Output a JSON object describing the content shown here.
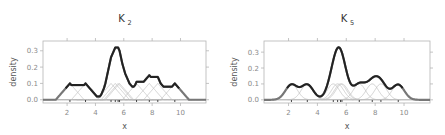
{
  "chart_data": [
    {
      "type": "line",
      "title": "K2",
      "title_main": "K",
      "title_sub": "2",
      "kernel": "triangular",
      "xlabel": "x",
      "ylabel": "density",
      "xlim": [
        0.3,
        11.8
      ],
      "ylim": [
        -0.02,
        0.36
      ],
      "xticks": [
        2,
        4,
        6,
        8,
        10
      ],
      "yticks": [
        0.0,
        0.1,
        0.2,
        0.3
      ],
      "ytick_labels": [
        "0.0",
        "0.1",
        "0.2",
        "0.3"
      ],
      "grid": false,
      "data_points": [
        2.2,
        3.3,
        5.1,
        5.4,
        5.6,
        5.7,
        6.9,
        7.8,
        8.4,
        9.6
      ],
      "bandwidth": 1.0,
      "peak_density": 0.32,
      "series": [
        {
          "name": "density estimate",
          "x": [
            0.3,
            1.2,
            2.2,
            2.7,
            3.3,
            4.3,
            4.6,
            5.1,
            5.4,
            5.6,
            5.7,
            6.0,
            6.4,
            6.9,
            7.3,
            7.8,
            8.4,
            8.8,
            9.6,
            10.6,
            11.8
          ],
          "values": [
            0,
            0,
            0.1,
            0.09,
            0.1,
            0.02,
            0.06,
            0.23,
            0.31,
            0.32,
            0.31,
            0.2,
            0.12,
            0.11,
            0.11,
            0.14,
            0.14,
            0.08,
            0.1,
            0,
            0
          ]
        }
      ],
      "frame_px": {
        "left": 43,
        "right": 206,
        "top": 41,
        "bottom": 103
      }
    },
    {
      "type": "line",
      "title": "K5",
      "title_main": "K",
      "title_sub": "5",
      "kernel": "gaussian",
      "xlabel": "x",
      "ylabel": "density",
      "xlim": [
        0.3,
        11.8
      ],
      "ylim": [
        -0.02,
        0.37
      ],
      "xticks": [
        2,
        4,
        6,
        8,
        10
      ],
      "yticks": [
        0.0,
        0.1,
        0.2,
        0.3
      ],
      "ytick_labels": [
        "0.0",
        "0.1",
        "0.2",
        "0.3"
      ],
      "grid": false,
      "data_points": [
        2.2,
        3.3,
        5.1,
        5.4,
        5.6,
        5.7,
        6.9,
        7.8,
        8.4,
        9.6
      ],
      "bandwidth": 0.42,
      "peak_density": 0.33,
      "series": [
        {
          "name": "density estimate",
          "x": [
            0.3,
            1.2,
            2.2,
            2.8,
            3.3,
            4.1,
            5.0,
            5.6,
            6.2,
            6.9,
            7.4,
            8.0,
            8.5,
            9.0,
            9.6,
            10.5,
            11.8
          ],
          "values": [
            0,
            0.001,
            0.1,
            0.08,
            0.1,
            0.02,
            0.2,
            0.33,
            0.12,
            0.11,
            0.12,
            0.15,
            0.12,
            0.07,
            0.1,
            0.01,
            0
          ]
        }
      ],
      "frame_px": {
        "left": 264,
        "right": 430,
        "top": 41,
        "bottom": 103
      }
    }
  ],
  "colors": {
    "density_curve": "#222222",
    "density_tail": "#777777",
    "kernel_lines": "#bdbdbd",
    "frame": "#b5b5b5",
    "tick_text": "#8a8a8a",
    "baseline": "#666666",
    "rug": "#333333"
  }
}
